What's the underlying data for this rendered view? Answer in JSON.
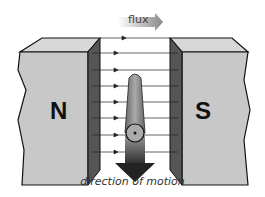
{
  "diagram": {
    "flux_label": "flux",
    "north_label": "N",
    "south_label": "S",
    "caption": "direction of motion",
    "colors": {
      "magnet_face": "#c8c8c8",
      "magnet_top": "#d8d8d8",
      "magnet_inner": "#555555",
      "conductor": "#8a8a8a",
      "arrow": "#555555",
      "flux_arrow": "#9a9a9a"
    },
    "flux_lines_count": 8
  }
}
